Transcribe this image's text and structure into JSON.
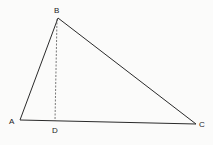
{
  "diagram": {
    "type": "triangle-with-altitude",
    "colors": {
      "line": "#2a2a2a",
      "background": "#fbfbfa"
    },
    "vertices": {
      "A": {
        "label": "A",
        "x": 20,
        "y": 120
      },
      "B": {
        "label": "B",
        "x": 58,
        "y": 18
      },
      "C": {
        "label": "C",
        "x": 196,
        "y": 124
      },
      "D": {
        "label": "D",
        "x": 55,
        "y": 121
      }
    },
    "segments": [
      {
        "from": "A",
        "to": "B",
        "style": "solid"
      },
      {
        "from": "B",
        "to": "C",
        "style": "solid"
      },
      {
        "from": "A",
        "to": "C",
        "style": "solid"
      },
      {
        "from": "B",
        "to": "D",
        "style": "dashed",
        "note": "altitude"
      }
    ]
  }
}
